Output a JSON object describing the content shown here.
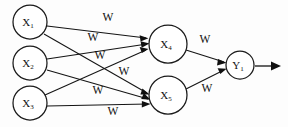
{
  "diagram": {
    "background_color": "#fdfdfd",
    "stroke_color": "#141414",
    "nodes": [
      {
        "id": "x1",
        "label": "X",
        "subscript": "1",
        "layer": "input",
        "cx": 30,
        "cy": 22,
        "r": 17
      },
      {
        "id": "x2",
        "label": "X",
        "subscript": "2",
        "layer": "input",
        "cx": 30,
        "cy": 63,
        "r": 17
      },
      {
        "id": "x3",
        "label": "X",
        "subscript": "3",
        "layer": "input",
        "cx": 30,
        "cy": 103,
        "r": 17
      },
      {
        "id": "x4",
        "label": "X",
        "subscript": "4",
        "layer": "hidden",
        "cx": 168,
        "cy": 44,
        "r": 19
      },
      {
        "id": "x5",
        "label": "X",
        "subscript": "5",
        "layer": "hidden",
        "cx": 168,
        "cy": 95,
        "r": 19
      },
      {
        "id": "y1",
        "label": "Y",
        "subscript": "1",
        "layer": "output",
        "cx": 240,
        "cy": 65,
        "r": 14
      }
    ],
    "edges": [
      {
        "id": "e-x1-x4",
        "from": "x1",
        "to": "x4",
        "weight_label": "W"
      },
      {
        "id": "e-x1-x5",
        "from": "x1",
        "to": "x5",
        "weight_label": "W"
      },
      {
        "id": "e-x2-x4",
        "from": "x2",
        "to": "x4",
        "weight_label": "W"
      },
      {
        "id": "e-x2-x5",
        "from": "x2",
        "to": "x5",
        "weight_label": "W"
      },
      {
        "id": "e-x3-x4",
        "from": "x3",
        "to": "x4",
        "weight_label": "W"
      },
      {
        "id": "e-x3-x5",
        "from": "x3",
        "to": "x5",
        "weight_label": "W"
      },
      {
        "id": "e-x4-y1",
        "from": "x4",
        "to": "y1",
        "weight_label": "W"
      },
      {
        "id": "e-x5-y1",
        "from": "x5",
        "to": "y1",
        "weight_label": "W"
      }
    ],
    "weight_labels": [
      {
        "id": "w1",
        "text": "W",
        "x": 108,
        "y": 18
      },
      {
        "id": "w2",
        "text": "W",
        "x": 93,
        "y": 38
      },
      {
        "id": "w3",
        "text": "W",
        "x": 100,
        "y": 56
      },
      {
        "id": "w4",
        "text": "W",
        "x": 124,
        "y": 72
      },
      {
        "id": "w5",
        "text": "W",
        "x": 98,
        "y": 91
      },
      {
        "id": "w6",
        "text": "W",
        "x": 113,
        "y": 112
      },
      {
        "id": "w7",
        "text": "W",
        "x": 205,
        "y": 40
      },
      {
        "id": "w8",
        "text": "W",
        "x": 207,
        "y": 89
      }
    ],
    "output_arrow": {
      "id": "output-arrow",
      "x_start": 255,
      "x_end": 280,
      "y": 66
    }
  }
}
